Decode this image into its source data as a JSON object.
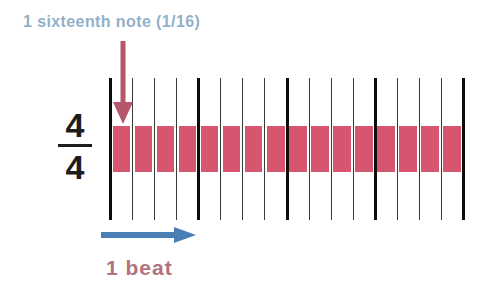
{
  "title": "1 sixteenth note (1/16)",
  "time_signature": {
    "numerator": "4",
    "denominator": "4"
  },
  "beat_label": "1 beat",
  "colors": {
    "title_text": "#93b0c9",
    "note_block": "#d6566f",
    "down_arrow": "#b5566b",
    "beat_arrow": "#4a7fb5",
    "beat_label_text": "#b4717f",
    "thick_line": "#0d0d0d",
    "thin_line": "#3a3a3a",
    "background": "#ffffff"
  },
  "chart_data": {
    "type": "bar",
    "title": "1 sixteenth note (1/16)",
    "xlabel": "1 beat",
    "ylabel": "",
    "grid": true,
    "legend": "none",
    "categories": [
      "1",
      "2",
      "3",
      "4",
      "5",
      "6",
      "7",
      "8",
      "9",
      "10",
      "11",
      "12",
      "13",
      "14",
      "15",
      "16"
    ],
    "values": [
      1,
      1,
      1,
      1,
      1,
      1,
      1,
      1,
      1,
      1,
      1,
      1,
      1,
      1,
      1,
      1
    ],
    "notes_per_beat": 4,
    "beats_per_measure": 4,
    "total_subdivisions": 16,
    "subdivision_value": "1/16",
    "beat_boundaries": [
      0,
      4,
      8,
      12,
      16
    ]
  },
  "grid": {
    "left": 110,
    "top": 78,
    "height": 142,
    "cell_width": 22.0625,
    "line_count": 17,
    "thick_line_indices": [
      0,
      4,
      8,
      12,
      16
    ],
    "band_top": 48,
    "band_height": 46
  }
}
